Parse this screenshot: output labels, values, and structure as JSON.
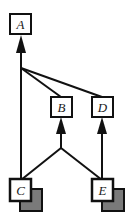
{
  "diagram": {
    "nodes": [
      {
        "id": "A",
        "label": "A",
        "style": "plain"
      },
      {
        "id": "B",
        "label": "B",
        "style": "plain"
      },
      {
        "id": "D",
        "label": "D",
        "style": "plain"
      },
      {
        "id": "C",
        "label": "C",
        "style": "shadowed"
      },
      {
        "id": "E",
        "label": "E",
        "style": "shadowed"
      }
    ],
    "edges": [
      {
        "from": [
          "C",
          "B",
          "D"
        ],
        "to": "A",
        "type": "merge-arrow"
      },
      {
        "from": [
          "C",
          "E"
        ],
        "to": "B",
        "type": "merge-arrow"
      },
      {
        "from": "E",
        "to": "D",
        "type": "arrow"
      }
    ],
    "colors": {
      "stroke": "#111111",
      "box_fill": "#ffffff",
      "shadow_fill": "#7a7a7a"
    }
  }
}
